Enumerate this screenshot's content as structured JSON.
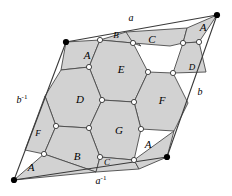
{
  "figure": {
    "colors": {
      "face_fill": "#d2d2d2",
      "outline": "#3a3a3a",
      "edge_stroke": "#4a4a4a",
      "vertex_fill": "#ffffff",
      "vertex_stroke": "#333333",
      "corner_fill": "#000000",
      "background": "#ffffff",
      "text": "#000000"
    },
    "parallelogram": {
      "corners": [
        {
          "name": "top-left",
          "x": 66,
          "y": 42
        },
        {
          "name": "top-right",
          "x": 217,
          "y": 15
        },
        {
          "name": "bottom-right",
          "x": 167,
          "y": 157
        },
        {
          "name": "bottom-left",
          "x": 14,
          "y": 180
        }
      ]
    },
    "edge_labels": [
      {
        "id": "edge-a",
        "base": "a",
        "exponent": "",
        "x": 131,
        "y": 19
      },
      {
        "id": "edge-b",
        "base": "b",
        "exponent": "",
        "x": 200,
        "y": 93
      },
      {
        "id": "edge-a-inverse",
        "base": "a",
        "exponent": "-1",
        "x": 101,
        "y": 182
      },
      {
        "id": "edge-b-inverse",
        "base": "b",
        "exponent": "-1",
        "x": 22,
        "y": 101
      }
    ],
    "face_labels": [
      {
        "id": "face-A-topleft",
        "label": "A",
        "x": 87,
        "y": 56,
        "size": "normal"
      },
      {
        "id": "face-B-top",
        "label": "B",
        "x": 116,
        "y": 36,
        "size": "small"
      },
      {
        "id": "face-C-top",
        "label": "C",
        "x": 152,
        "y": 40,
        "size": "normal"
      },
      {
        "id": "face-A-topright",
        "label": "A",
        "x": 203,
        "y": 28,
        "size": "normal"
      },
      {
        "id": "face-D-right",
        "label": "D",
        "x": 192,
        "y": 68,
        "size": "small"
      },
      {
        "id": "face-E-center",
        "label": "E",
        "x": 121,
        "y": 70,
        "size": "normal"
      },
      {
        "id": "face-D-left",
        "label": "D",
        "x": 80,
        "y": 100,
        "size": "normal"
      },
      {
        "id": "face-F-right",
        "label": "F",
        "x": 162,
        "y": 101,
        "size": "normal"
      },
      {
        "id": "face-G-center",
        "label": "G",
        "x": 119,
        "y": 131,
        "size": "normal"
      },
      {
        "id": "face-F-left",
        "label": "F",
        "x": 38,
        "y": 134,
        "size": "small"
      },
      {
        "id": "face-B-bottom",
        "label": "B",
        "x": 77,
        "y": 157,
        "size": "normal"
      },
      {
        "id": "face-C-bottom",
        "label": "C",
        "x": 107,
        "y": 163,
        "size": "small"
      },
      {
        "id": "face-A-bottomright",
        "label": "A",
        "x": 148,
        "y": 145,
        "size": "normal"
      },
      {
        "id": "face-A-bottomleft",
        "label": "A",
        "x": 31,
        "y": 168,
        "size": "normal"
      }
    ],
    "faces": [
      {
        "id": "face-poly-A-topleft",
        "label": "A",
        "points": "66,42 100,40 89,67 61,70"
      },
      {
        "id": "face-poly-B-top",
        "label": "B",
        "points": "100,40 133,43 141,46 126,32"
      },
      {
        "id": "face-poly-C-top",
        "label": "C",
        "points": "133,43 170,46 183,43 187,28 126,32"
      },
      {
        "id": "face-poly-A-topright",
        "label": "A",
        "points": "187,28 183,43 199,42 217,15"
      },
      {
        "id": "face-poly-D-right",
        "label": "D",
        "points": "183,43 199,42 206,72 173,73"
      },
      {
        "id": "face-poly-E-center",
        "label": "E",
        "points": "100,40 133,43 148,72 134,102 102,100 89,67"
      },
      {
        "id": "face-poly-D-left",
        "label": "D",
        "points": "61,70 89,67 102,100 89,128 56,126 45,96"
      },
      {
        "id": "face-poly-F-right",
        "label": "F",
        "points": "148,72 173,73 188,103 174,131 141,129 134,102"
      },
      {
        "id": "face-poly-G-center",
        "label": "G",
        "points": "102,100 134,102 141,129 134,160 100,157 89,128"
      },
      {
        "id": "face-poly-F-left",
        "label": "F",
        "points": "45,96 56,126 44,154 25,150"
      },
      {
        "id": "face-poly-B-bottom",
        "label": "B",
        "points": "56,126 89,128 100,157 96,172 44,154"
      },
      {
        "id": "face-poly-C-bottom",
        "label": "C",
        "points": "100,157 134,160 139,169 96,172"
      },
      {
        "id": "face-poly-A-bottomright",
        "label": "A",
        "points": "134,160 174,131 167,157 139,169"
      },
      {
        "id": "face-poly-A-bottomleft",
        "label": "A",
        "points": "44,154 96,172 14,180"
      }
    ],
    "vertices": [
      {
        "id": "vertex-1",
        "x": 100,
        "y": 40
      },
      {
        "id": "vertex-2",
        "x": 133,
        "y": 43
      },
      {
        "id": "vertex-3",
        "x": 183,
        "y": 43
      },
      {
        "id": "vertex-4",
        "x": 199,
        "y": 42
      },
      {
        "id": "vertex-5",
        "x": 89,
        "y": 67
      },
      {
        "id": "vertex-6",
        "x": 148,
        "y": 72
      },
      {
        "id": "vertex-7",
        "x": 173,
        "y": 73
      },
      {
        "id": "vertex-8",
        "x": 102,
        "y": 100
      },
      {
        "id": "vertex-9",
        "x": 134,
        "y": 102
      },
      {
        "id": "vertex-10",
        "x": 56,
        "y": 126
      },
      {
        "id": "vertex-11",
        "x": 89,
        "y": 128
      },
      {
        "id": "vertex-12",
        "x": 141,
        "y": 129
      },
      {
        "id": "vertex-13",
        "x": 44,
        "y": 154
      },
      {
        "id": "vertex-14",
        "x": 100,
        "y": 157
      },
      {
        "id": "vertex-15",
        "x": 134,
        "y": 160
      }
    ],
    "corner_dots": [
      {
        "id": "corner-dot-top-left",
        "x": 66,
        "y": 42
      },
      {
        "id": "corner-dot-top-right",
        "x": 217,
        "y": 15
      },
      {
        "id": "corner-dot-bottom-right",
        "x": 167,
        "y": 157
      },
      {
        "id": "corner-dot-bottom-left",
        "x": 14,
        "y": 180
      }
    ]
  }
}
